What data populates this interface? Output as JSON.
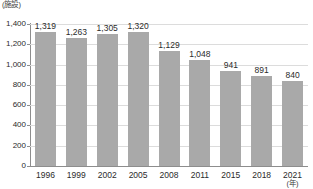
{
  "chart_data": {
    "type": "bar",
    "title": "",
    "subtitle": "",
    "xlabel": "(年)",
    "ylabel": "(施設)",
    "categories": [
      "1996",
      "1999",
      "2002",
      "2005",
      "2008",
      "2011",
      "2015",
      "2018",
      "2021"
    ],
    "values": [
      1319,
      1263,
      1305,
      1320,
      1129,
      1048,
      941,
      891,
      840
    ],
    "value_labels": [
      "1,319",
      "1,263",
      "1,305",
      "1,320",
      "1,129",
      "1,048",
      "941",
      "891",
      "840"
    ],
    "ylim": [
      0,
      1400
    ],
    "yticks": [
      0,
      200,
      400,
      600,
      800,
      1000,
      1200,
      1400
    ],
    "ytick_labels": [
      "0",
      "200",
      "400",
      "600",
      "800",
      "1,000",
      "1,200",
      "1,400"
    ],
    "grid": true,
    "legend": false,
    "legend_position": "none",
    "series": [
      {
        "name": "",
        "values": [
          1319,
          1263,
          1305,
          1320,
          1129,
          1048,
          941,
          891,
          840
        ],
        "color": "#a9a9a9"
      }
    ]
  },
  "colors": {
    "bar": "#a9a9a9",
    "gridline": "#dcdcdc",
    "axis": "#8d8d8d",
    "text": "#2b2b2b",
    "background": "#ffffff"
  }
}
